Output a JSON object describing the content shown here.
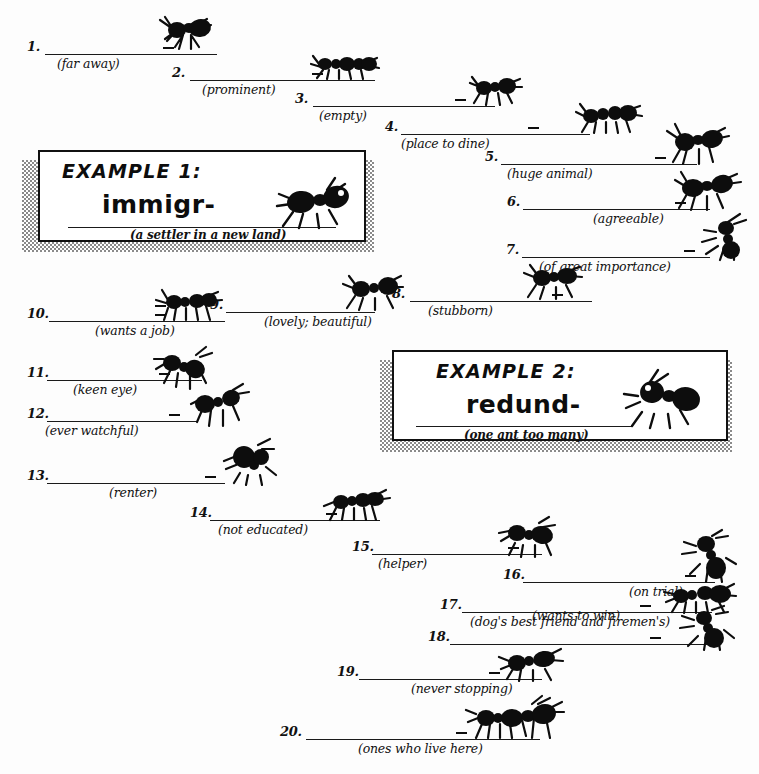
{
  "worksheet": {
    "title_visible": false,
    "ink_color": "#111111",
    "paper_color": "#fdfdfd"
  },
  "examples": [
    {
      "label": "EXAMPLE 1:",
      "answer": "immigr-",
      "clue": "(a settler in a new land)",
      "ant_count": 1
    },
    {
      "label": "EXAMPLE 2:",
      "answer": "redund-",
      "clue": "(one ant too many)",
      "ant_count": 1
    }
  ],
  "items": [
    {
      "number": "1.",
      "clue": "(far away)",
      "ants": 1
    },
    {
      "number": "2.",
      "clue": "(prominent)",
      "ants": 2
    },
    {
      "number": "3.",
      "clue": "(empty)",
      "ants": 1
    },
    {
      "number": "4.",
      "clue": "(place to dine)",
      "ants": 2
    },
    {
      "number": "5.",
      "clue": "(huge animal)",
      "ants": 1
    },
    {
      "number": "6.",
      "clue": "(agreeable)",
      "ants": 1
    },
    {
      "number": "7.",
      "clue": "(of great importance)",
      "ants": 1
    },
    {
      "number": "8.",
      "clue": "(stubborn)",
      "ants": 1
    },
    {
      "number": "9.",
      "clue": "(lovely; beautiful)",
      "ants": 1
    },
    {
      "number": "10.",
      "clue": "(wants a job)",
      "ants": 2
    },
    {
      "number": "11.",
      "clue": "(keen eye)",
      "ants": 1
    },
    {
      "number": "12.",
      "clue": "(ever watchful)",
      "ants": 1
    },
    {
      "number": "13.",
      "clue": "(renter)",
      "ants": 1
    },
    {
      "number": "14.",
      "clue": "(not educated)",
      "ants": 2
    },
    {
      "number": "15.",
      "clue": "(helper)",
      "ants": 1
    },
    {
      "number": "16.",
      "clue": "(on trial)",
      "ants": 1
    },
    {
      "number": "17.",
      "clue": "(dog's best friend and firemen's)",
      "ants": 2
    },
    {
      "number": "18.",
      "clue": "(wants to win)",
      "ants": 1
    },
    {
      "number": "19.",
      "clue": "(never stopping)",
      "ants": 1
    },
    {
      "number": "20.",
      "clue": "(ones who live here)",
      "ants": 2
    }
  ]
}
